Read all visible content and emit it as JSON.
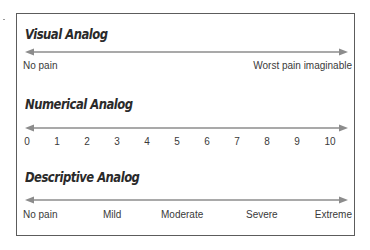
{
  "sections": {
    "visual": {
      "title": "Visual Analog",
      "labels": {
        "left": "No pain",
        "right": "Worst pain imaginable"
      }
    },
    "numerical": {
      "title": "Numerical Analog",
      "ticks": [
        "0",
        "1",
        "2",
        "3",
        "4",
        "5",
        "6",
        "7",
        "8",
        "9",
        "10"
      ]
    },
    "descriptive": {
      "title": "Descriptive Analog",
      "labels": [
        "No pain",
        "Mild",
        "Moderate",
        "Severe",
        "Extreme"
      ]
    }
  },
  "colors": {
    "arrow": "#8c8c8c",
    "frame": "#5c5c5c",
    "text": "#333333"
  }
}
